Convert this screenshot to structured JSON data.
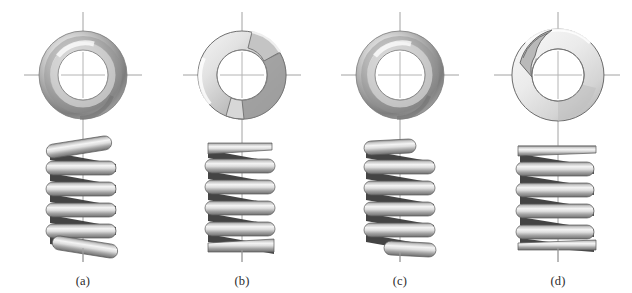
{
  "figure": {
    "background_color": "#ffffff",
    "width": 632,
    "height": 293,
    "panel_count": 4
  },
  "palette": {
    "wire_light": "#f2f2f2",
    "wire_mid": "#b8b8b8",
    "wire_dark": "#6e6e6e",
    "wire_shadow": "#3a3a3a",
    "outline": "#4a4a4a",
    "centerline": "#9a9a9a",
    "caption_text": "#2b2b2b",
    "dark_gap": "#2e2e2e"
  },
  "panels": [
    {
      "id": "a",
      "label": "(a)",
      "end_type": "plain ends",
      "center_x": 83,
      "top_view": {
        "name": "plain-end-top-view",
        "outer_radius": 44,
        "inner_radius": 25,
        "center_y": 75,
        "gap_visible": false,
        "ground_flat": false
      },
      "side_view": {
        "name": "plain-end-side-view",
        "coils": 5,
        "pitch": 21,
        "top_y": 140,
        "bottom_y": 256,
        "ends_open": true,
        "ends_ground": false,
        "end_tilt_deg": 18
      }
    },
    {
      "id": "b",
      "label": "(b)",
      "end_type": "plain ends, ground",
      "center_x": 242,
      "top_view": {
        "name": "plain-ground-end-top-view",
        "outer_radius": 44,
        "inner_radius": 25,
        "center_y": 75,
        "gap_visible": true,
        "ground_flat": true
      },
      "side_view": {
        "name": "plain-ground-end-side-view",
        "coils": 5,
        "pitch": 21,
        "top_y": 142,
        "bottom_y": 252,
        "ends_open": true,
        "ends_ground": true,
        "end_tilt_deg": 12
      }
    },
    {
      "id": "c",
      "label": "(c)",
      "end_type": "squared or closed ends",
      "center_x": 400,
      "top_view": {
        "name": "squared-end-top-view",
        "outer_radius": 44,
        "inner_radius": 25,
        "center_y": 75,
        "gap_visible": false,
        "ground_flat": false
      },
      "side_view": {
        "name": "squared-end-side-view",
        "coils": 5,
        "pitch": 21,
        "top_y": 140,
        "bottom_y": 256,
        "ends_open": false,
        "ends_ground": false,
        "end_tilt_deg": 4
      }
    },
    {
      "id": "d",
      "label": "(d)",
      "end_type": "squared and ground ends",
      "center_x": 558,
      "top_view": {
        "name": "squared-ground-end-top-view",
        "outer_radius": 46,
        "inner_radius": 26,
        "center_y": 75,
        "gap_visible": true,
        "ground_flat": true
      },
      "side_view": {
        "name": "squared-ground-end-side-view",
        "coils": 5,
        "pitch": 21,
        "top_y": 146,
        "bottom_y": 250,
        "ends_open": false,
        "ends_ground": true,
        "end_tilt_deg": 0
      }
    }
  ],
  "centerlines": {
    "name": "centerline-axes",
    "horizontal_y": 75,
    "vertical_top_y": 12,
    "vertical_bottom_y": 262,
    "color": "#9a9a9a",
    "width_px": 1
  },
  "captions": [
    "(a)",
    "(b)",
    "(c)",
    "(d)"
  ]
}
